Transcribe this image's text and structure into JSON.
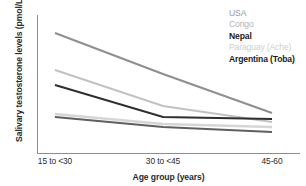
{
  "chart_data": {
    "type": "line",
    "title": "",
    "xlabel": "Age group (years)",
    "ylabel": "Salivary testosterone levels (pmol/L)",
    "categories": [
      "15 to <30",
      "30 to <45",
      "45-60"
    ],
    "grid": false,
    "legend_position": "top-right",
    "axis_ticks_y": [],
    "series": [
      {
        "name": "USA",
        "values": [
          213,
          148,
          64
        ],
        "color": "#8f8f8f",
        "bold": false
      },
      {
        "name": "Congo",
        "values": [
          153,
          93,
          58
        ],
        "color": "#c0c0c0",
        "bold": false
      },
      {
        "name": "Nepal",
        "values": [
          130,
          61,
          58
        ],
        "color": "#3a3a3a",
        "bold": true
      },
      {
        "name": "Paraguay (Ache)",
        "values": [
          89,
          71,
          43
        ],
        "color": "#d5d5d5",
        "bold": false
      },
      {
        "name": "Argentina (Toba)",
        "values": [
          85,
          45,
          33
        ],
        "color": "#6e6e6e",
        "bold": true
      }
    ],
    "ylim": [
      0,
      240
    ],
    "pixel_series": [
      {
        "name": "USA",
        "pts": [
          [
            55,
            33
          ],
          [
            163,
            74
          ],
          [
            272,
            113
          ]
        ],
        "color": "#8f8f8f",
        "width": 2.1
      },
      {
        "name": "Congo",
        "pts": [
          [
            55,
            70
          ],
          [
            163,
            106
          ],
          [
            272,
            122
          ]
        ],
        "color": "#c2c2c2",
        "width": 2.1
      },
      {
        "name": "Nepal",
        "pts": [
          [
            55,
            85
          ],
          [
            163,
            117
          ],
          [
            272,
            119
          ]
        ],
        "color": "#2f2f2f",
        "width": 2.1
      },
      {
        "name": "Paraguay (Ache)",
        "pts": [
          [
            55,
            114
          ],
          [
            163,
            124
          ],
          [
            272,
            127
          ]
        ],
        "color": "#d6d6d6",
        "width": 2.4
      },
      {
        "name": "Argentina (Toba)",
        "pts": [
          [
            55,
            117
          ],
          [
            163,
            127
          ],
          [
            272,
            132
          ]
        ],
        "color": "#5f5f5f",
        "width": 2.1
      }
    ]
  },
  "legend": {
    "items": [
      {
        "label": "USA",
        "color": "#9a9a9a",
        "weight": "400"
      },
      {
        "label": "Congo",
        "color": "#b4b4b4",
        "weight": "400"
      },
      {
        "label": "Nepal",
        "color": "#1c1c1c",
        "weight": "700"
      },
      {
        "label": "Paraguay (Ache)",
        "color": "#cfcfcf",
        "weight": "400"
      },
      {
        "label": "Argentina (Toba)",
        "color": "#1c1c1c",
        "weight": "700"
      }
    ]
  },
  "axes": {
    "y_title": "Salivary testosterone levels (pmol/L)",
    "x_title": "Age group (years)",
    "x_ticks": [
      {
        "label": "15 to <30",
        "x": 55
      },
      {
        "label": "30 to <45",
        "x": 163
      },
      {
        "label": "45-60",
        "x": 272
      }
    ],
    "axis_color": "#8c8c8c"
  }
}
